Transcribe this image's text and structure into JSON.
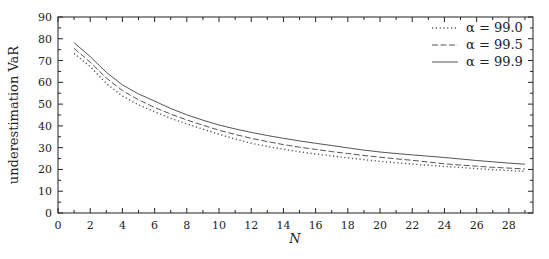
{
  "chart_data": {
    "type": "line",
    "title": "",
    "xlabel": "N",
    "ylabel": "underestimation VaR",
    "xlim": [
      0,
      29.5
    ],
    "ylim": [
      0,
      90
    ],
    "grid": false,
    "legend_position": "upper right",
    "xticks": [
      0,
      2,
      4,
      6,
      8,
      10,
      12,
      14,
      16,
      18,
      20,
      22,
      24,
      26,
      28
    ],
    "yticks": [
      0,
      10,
      20,
      30,
      40,
      50,
      60,
      70,
      80,
      90
    ],
    "x": [
      1,
      2,
      3,
      4,
      5,
      6,
      7,
      8,
      9,
      10,
      11,
      12,
      13,
      14,
      15,
      16,
      17,
      18,
      19,
      20,
      21,
      22,
      23,
      24,
      25,
      26,
      27,
      28,
      29
    ],
    "series": [
      {
        "name": "α = 99.0",
        "style": "dotted",
        "values": [
          73.3,
          67.2,
          59.5,
          53.7,
          49.7,
          46.5,
          43.5,
          40.9,
          38.5,
          36.2,
          34.0,
          32.0,
          30.6,
          29.3,
          28.1,
          27.1,
          26.2,
          25.3,
          24.5,
          23.7,
          23.1,
          22.5,
          21.9,
          21.4,
          20.9,
          20.4,
          19.9,
          19.5,
          19.1
        ]
      },
      {
        "name": "α = 99.5",
        "style": "dashed",
        "values": [
          75.6,
          69.3,
          62.0,
          56.2,
          52.0,
          48.5,
          45.4,
          42.7,
          40.3,
          38.0,
          36.1,
          34.3,
          32.8,
          31.4,
          30.2,
          29.2,
          28.2,
          27.3,
          26.4,
          25.6,
          24.9,
          24.2,
          23.4,
          22.6,
          22.0,
          21.5,
          21.0,
          20.6,
          20.2
        ]
      },
      {
        "name": "α = 99.9",
        "style": "solid",
        "values": [
          78.2,
          71.8,
          64.6,
          58.8,
          54.7,
          51.4,
          48.0,
          45.1,
          42.6,
          40.4,
          38.6,
          37.0,
          35.6,
          34.3,
          33.1,
          32.0,
          31.0,
          29.9,
          28.9,
          28.0,
          27.3,
          26.7,
          26.1,
          25.5,
          24.8,
          24.1,
          23.5,
          22.9,
          22.4
        ]
      }
    ]
  },
  "legend": {
    "items": [
      {
        "label": "α = 99.0",
        "style": "dotted"
      },
      {
        "label": "α = 99.5",
        "style": "dashed"
      },
      {
        "label": "α = 99.9",
        "style": "solid"
      }
    ]
  },
  "colors": {
    "line": "#555555",
    "axis": "#222222"
  }
}
